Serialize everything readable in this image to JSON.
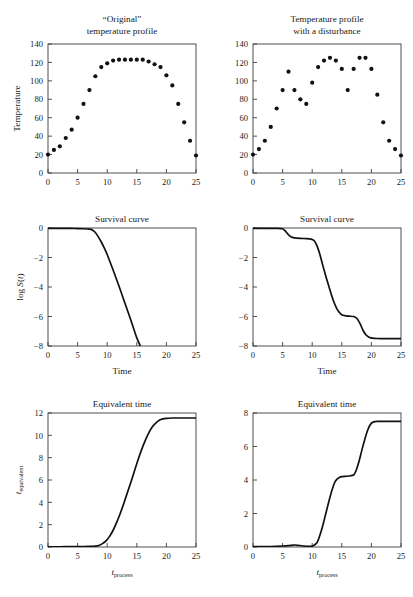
{
  "figure": {
    "background": "#ffffff",
    "ink": "#111111",
    "axis_color": "#3d3d3d"
  },
  "chart_data": [
    {
      "id": "temp-original",
      "panel": "top-left",
      "type": "scatter",
      "title": "“Original”\ntemperature profile",
      "title_line1": "“Original”",
      "title_line2": "temperature profile",
      "xlabel": "",
      "ylabel": "Temperature",
      "xlim": [
        0,
        25
      ],
      "ylim": [
        0,
        140
      ],
      "xticks": [
        0,
        5,
        10,
        15,
        20,
        25
      ],
      "yticks": [
        0,
        20,
        40,
        60,
        80,
        100,
        120,
        140
      ],
      "grid": false,
      "legend": "none",
      "marker": "filled-circle",
      "x": [
        0,
        1,
        2,
        3,
        4,
        5,
        6,
        7,
        8,
        9,
        10,
        11,
        12,
        13,
        14,
        15,
        16,
        17,
        18,
        19,
        20,
        21,
        22,
        23,
        24
      ],
      "y": [
        20,
        25,
        29,
        38,
        47,
        60,
        75,
        90,
        105,
        115,
        119,
        122,
        123,
        123,
        123,
        123,
        123,
        121,
        118,
        115,
        106,
        95,
        75,
        55,
        35
      ],
      "tail_x": [
        25
      ],
      "tail_y": [
        19
      ]
    },
    {
      "id": "temp-disturbance",
      "panel": "top-right",
      "type": "scatter",
      "title": "Temperature profile\nwith a disturbance",
      "title_line1": "Temperature profile",
      "title_line2": "with a disturbance",
      "xlabel": "",
      "ylabel": "",
      "xlim": [
        0,
        25
      ],
      "ylim": [
        0,
        140
      ],
      "xticks": [
        0,
        5,
        10,
        15,
        20,
        25
      ],
      "yticks": [
        0,
        20,
        40,
        60,
        80,
        100,
        120,
        140
      ],
      "grid": false,
      "legend": "none",
      "marker": "filled-circle",
      "x": [
        0,
        1,
        2,
        3,
        4,
        5,
        6,
        7,
        8,
        9,
        10,
        11,
        12,
        13,
        14,
        15,
        16,
        17,
        18,
        19,
        20,
        21,
        22,
        23,
        24,
        25
      ],
      "y": [
        20,
        26,
        35,
        50,
        70,
        90,
        110,
        90,
        80,
        75,
        98,
        115,
        122,
        125,
        122,
        113,
        90,
        113,
        125,
        125,
        113,
        85,
        55,
        35,
        26,
        19
      ]
    },
    {
      "id": "survival-original",
      "panel": "middle-left",
      "type": "line",
      "title": "Survival curve",
      "xlabel": "Time",
      "ylabel": "log S(t)",
      "xlim": [
        0,
        25
      ],
      "ylim": [
        -8,
        0
      ],
      "xticks": [
        0,
        5,
        10,
        15,
        20,
        25
      ],
      "yticks": [
        -8,
        -6,
        -4,
        -2,
        0
      ],
      "grid": false,
      "legend": "none",
      "x": [
        0,
        1,
        2,
        3,
        4,
        5,
        6,
        7,
        7.5,
        8,
        8.5,
        9,
        9.5,
        10,
        11,
        12,
        13,
        14,
        15,
        15.6
      ],
      "y": [
        -0.02,
        -0.02,
        -0.02,
        -0.02,
        -0.03,
        -0.04,
        -0.05,
        -0.08,
        -0.13,
        -0.3,
        -0.6,
        -0.95,
        -1.35,
        -1.8,
        -2.85,
        -3.95,
        -5.1,
        -6.25,
        -7.45,
        -8.0
      ]
    },
    {
      "id": "survival-disturbance",
      "panel": "middle-right",
      "type": "line",
      "title": "Survival curve",
      "xlabel": "Time",
      "ylabel": "",
      "xlim": [
        0,
        25
      ],
      "ylim": [
        -8,
        0
      ],
      "xticks": [
        0,
        5,
        10,
        15,
        20,
        25
      ],
      "yticks": [
        -8,
        -6,
        -4,
        -2,
        0
      ],
      "grid": false,
      "legend": "none",
      "x": [
        0,
        2,
        4,
        5,
        5.4,
        5.9,
        6.4,
        7,
        8,
        9,
        9.8,
        10.3,
        10.8,
        11.3,
        11.8,
        12.4,
        13,
        13.6,
        14.2,
        14.8,
        15.2,
        15.7,
        16.3,
        17,
        17.6,
        18.1,
        18.6,
        19.1,
        19.6,
        20.2,
        21,
        22,
        23,
        24,
        25
      ],
      "y": [
        -0.02,
        -0.02,
        -0.03,
        -0.05,
        -0.18,
        -0.42,
        -0.6,
        -0.67,
        -0.7,
        -0.72,
        -0.75,
        -0.85,
        -1.2,
        -1.8,
        -2.55,
        -3.4,
        -4.2,
        -4.95,
        -5.5,
        -5.82,
        -5.92,
        -5.96,
        -5.98,
        -6.0,
        -6.15,
        -6.5,
        -6.95,
        -7.25,
        -7.4,
        -7.47,
        -7.49,
        -7.5,
        -7.5,
        -7.5,
        -7.5
      ]
    },
    {
      "id": "equivalent-time-original",
      "panel": "bottom-left",
      "type": "line",
      "title": "Equivalent time",
      "xlabel": "t_process",
      "xlabel_main": "t",
      "xlabel_sub": "process",
      "ylabel": "t_equivalent",
      "ylabel_main": "t",
      "ylabel_sub": "equivalent",
      "xlim": [
        0,
        25
      ],
      "ylim": [
        0,
        12
      ],
      "xticks": [
        0,
        5,
        10,
        15,
        20,
        25
      ],
      "yticks": [
        0,
        2,
        4,
        6,
        8,
        10,
        12
      ],
      "grid": false,
      "legend": "none",
      "x": [
        0,
        2,
        4,
        6,
        7,
        8,
        8.6,
        9.2,
        9.8,
        10.4,
        11,
        11.6,
        12.2,
        12.8,
        13.4,
        14,
        14.6,
        15.2,
        15.8,
        16.4,
        17,
        17.6,
        18.2,
        18.8,
        19.4,
        20,
        21,
        22,
        23,
        24,
        25
      ],
      "y": [
        0.02,
        0.02,
        0.03,
        0.04,
        0.05,
        0.08,
        0.14,
        0.3,
        0.55,
        0.95,
        1.5,
        2.2,
        3.0,
        3.9,
        4.85,
        5.8,
        6.8,
        7.8,
        8.7,
        9.5,
        10.2,
        10.75,
        11.1,
        11.35,
        11.47,
        11.52,
        11.55,
        11.55,
        11.55,
        11.55,
        11.55
      ]
    },
    {
      "id": "equivalent-time-disturbance",
      "panel": "bottom-right",
      "type": "line",
      "title": "Equivalent time",
      "xlabel": "t_process",
      "xlabel_main": "t",
      "xlabel_sub": "process",
      "ylabel": "",
      "xlim": [
        0,
        25
      ],
      "ylim": [
        0,
        8
      ],
      "xticks": [
        0,
        5,
        10,
        15,
        20,
        25
      ],
      "yticks": [
        0,
        2,
        4,
        6,
        8
      ],
      "grid": false,
      "legend": "none",
      "x": [
        0,
        3,
        5,
        6.5,
        7,
        7.6,
        8.5,
        10,
        10.8,
        11.3,
        11.8,
        12.3,
        12.8,
        13.3,
        13.8,
        14.2,
        14.6,
        15,
        15.6,
        16.3,
        17,
        17.4,
        17.9,
        18.4,
        18.9,
        19.4,
        19.9,
        20.4,
        21,
        22,
        23,
        24,
        25
      ],
      "y": [
        0.02,
        0.03,
        0.06,
        0.1,
        0.12,
        0.1,
        0.06,
        0.05,
        0.25,
        0.7,
        1.3,
        2.0,
        2.7,
        3.35,
        3.85,
        4.05,
        4.15,
        4.2,
        4.22,
        4.24,
        4.3,
        4.55,
        5.1,
        5.8,
        6.45,
        7.0,
        7.35,
        7.47,
        7.5,
        7.5,
        7.5,
        7.5,
        7.5
      ]
    }
  ]
}
